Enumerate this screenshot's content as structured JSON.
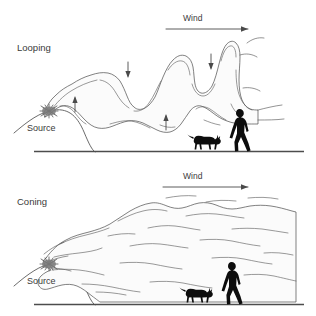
{
  "figure": {
    "title_implicit": "Plume dispersion patterns",
    "background_color": "#ffffff",
    "ink_color": "#3a3a3a",
    "silhouette_color": "#0d0d0d",
    "plume_fill_color": "#fbfbfb"
  },
  "panels": [
    {
      "id": "looping",
      "label": "Looping",
      "wind_label": "Wind",
      "source_label": "Source",
      "wind_direction": "left-to-right",
      "turbulence_arrows": [
        {
          "direction": "up",
          "x": 75,
          "y": 103
        },
        {
          "direction": "down",
          "x": 128,
          "y": 70
        },
        {
          "direction": "up",
          "x": 166,
          "y": 121
        },
        {
          "direction": "down",
          "x": 211,
          "y": 62
        }
      ],
      "scale_figures": [
        "dog",
        "person"
      ]
    },
    {
      "id": "coning",
      "label": "Coning",
      "wind_label": "Wind",
      "source_label": "Source",
      "wind_direction": "left-to-right",
      "turbulence_arrows": [],
      "scale_figures": [
        "dog",
        "person"
      ]
    }
  ],
  "icons": {
    "wind_arrow": "arrow-right-icon",
    "up_arrow": "arrow-up-icon",
    "down_arrow": "arrow-down-icon",
    "source_marker": "starburst-source-icon",
    "person": "walking-person-silhouette-icon",
    "dog": "dog-silhouette-icon"
  }
}
